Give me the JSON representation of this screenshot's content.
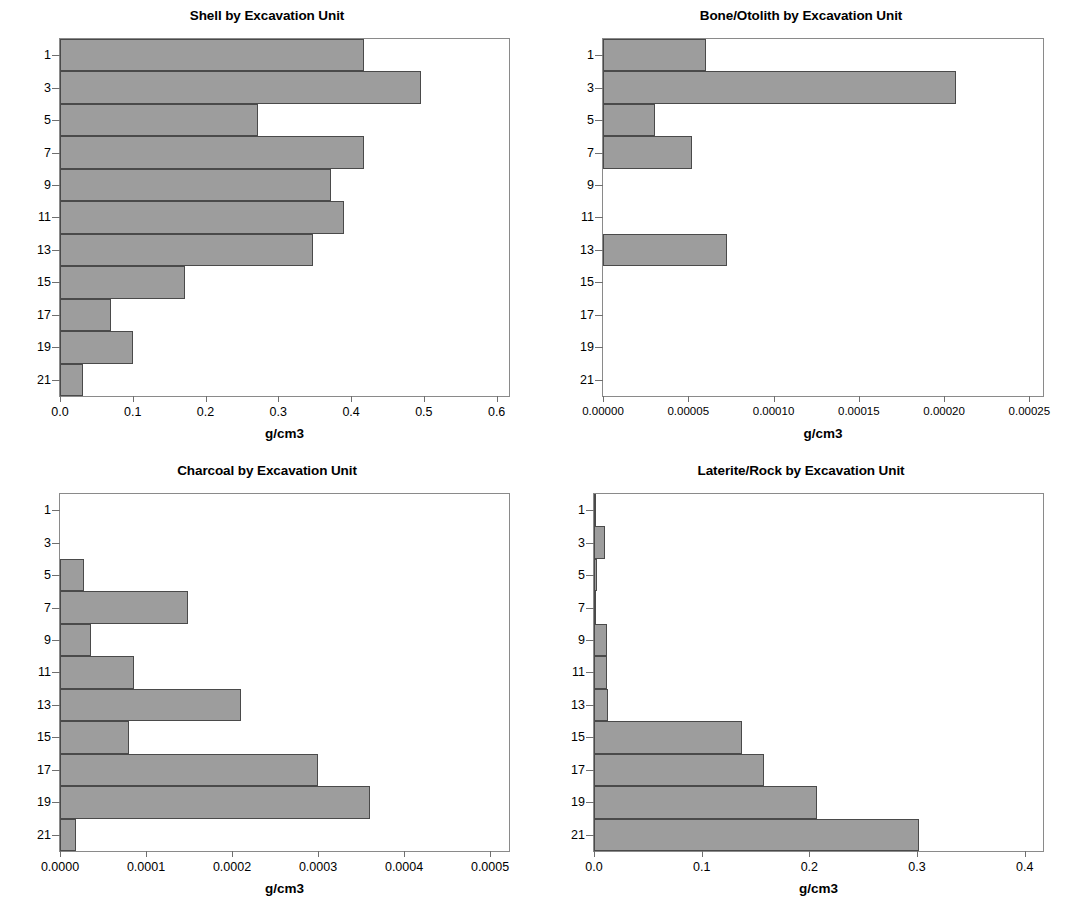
{
  "figure": {
    "axis_label_y": "Excavation Unit",
    "axis_label_x": "g/cm3",
    "bar_fill": "#9d9d9d",
    "bar_edge": "#4a4a4a",
    "background": "#ffffff"
  },
  "chart_data": [
    {
      "type": "bar",
      "orientation": "horizontal",
      "title": "Shell by Excavation Unit",
      "xlabel": "g/cm3",
      "ylabel": "Excavation Unit",
      "categories": [
        "1",
        "2",
        "3",
        "4",
        "5",
        "6",
        "7",
        "8",
        "9",
        "10",
        "11"
      ],
      "tick_labels": [
        "1",
        "3",
        "5",
        "7",
        "9",
        "11",
        "13",
        "15",
        "17",
        "19",
        "21"
      ],
      "values": [
        0.418,
        0.496,
        0.272,
        0.418,
        0.373,
        0.39,
        0.347,
        0.172,
        0.07,
        0.101,
        0.031
      ],
      "xlim": [
        0.0,
        0.617
      ],
      "xticks": [
        0.0,
        0.1,
        0.2,
        0.3,
        0.4,
        0.5,
        0.6
      ],
      "xtick_labels": [
        "0.0",
        "0.1",
        "0.2",
        "0.3",
        "0.4",
        "0.5",
        "0.6"
      ],
      "grid": false,
      "legend": false
    },
    {
      "type": "bar",
      "orientation": "horizontal",
      "title": "Bone/Otolith by Excavation Unit",
      "xlabel": "g/cm3",
      "ylabel": "Excavation Unit",
      "categories": [
        "1",
        "2",
        "3",
        "4",
        "5",
        "6",
        "7",
        "8",
        "9",
        "10",
        "11"
      ],
      "tick_labels": [
        "1",
        "3",
        "5",
        "7",
        "9",
        "11",
        "13",
        "15",
        "17",
        "19",
        "21"
      ],
      "values": [
        6.05e-05,
        0.000207,
        3.05e-05,
        5.2e-05,
        0.0,
        0.0,
        7.27e-05,
        0.0,
        0.0,
        0.0,
        0.0
      ],
      "xlim": [
        0.0,
        0.000258
      ],
      "xticks": [
        0.0,
        5e-05,
        0.0001,
        0.00015,
        0.0002,
        0.00025
      ],
      "xtick_labels": [
        "0.00000",
        "0.00005",
        "0.00010",
        "0.00015",
        "0.00020",
        "0.00025"
      ],
      "grid": false,
      "legend": false
    },
    {
      "type": "bar",
      "orientation": "horizontal",
      "title": "Charcoal by Excavation Unit",
      "xlabel": "g/cm3",
      "ylabel": "Excavation Unit",
      "categories": [
        "1",
        "2",
        "3",
        "4",
        "5",
        "6",
        "7",
        "8",
        "9",
        "10",
        "11"
      ],
      "tick_labels": [
        "1",
        "3",
        "5",
        "7",
        "9",
        "11",
        "13",
        "15",
        "17",
        "19",
        "21"
      ],
      "values": [
        0.0,
        0.0,
        2.78e-05,
        0.000149,
        3.58e-05,
        8.66e-05,
        0.00021,
        8e-05,
        0.0003,
        0.00036,
        1.85e-05
      ],
      "xlim": [
        0.0,
        0.000522
      ],
      "xticks": [
        0.0,
        0.0001,
        0.0002,
        0.0003,
        0.0004,
        0.0005
      ],
      "xtick_labels": [
        "0.0000",
        "0.0001",
        "0.0002",
        "0.0003",
        "0.0004",
        "0.0005"
      ],
      "grid": false,
      "legend": false
    },
    {
      "type": "bar",
      "orientation": "horizontal",
      "title": "Laterite/Rock by Excavation Unit",
      "xlabel": "g/cm3",
      "ylabel": "Excavation Unit",
      "categories": [
        "1",
        "2",
        "3",
        "4",
        "5",
        "6",
        "7",
        "8",
        "9",
        "10",
        "11"
      ],
      "tick_labels": [
        "1",
        "3",
        "5",
        "7",
        "9",
        "11",
        "13",
        "15",
        "17",
        "19",
        "21"
      ],
      "values": [
        0.002,
        0.01,
        0.003,
        0.001,
        0.012,
        0.012,
        0.013,
        0.137,
        0.158,
        0.207,
        0.302
      ],
      "xlim": [
        0.0,
        0.417
      ],
      "xticks": [
        0.0,
        0.1,
        0.2,
        0.3,
        0.4
      ],
      "xtick_labels": [
        "0.0",
        "0.1",
        "0.2",
        "0.3",
        "0.4"
      ],
      "grid": false,
      "legend": false
    }
  ]
}
